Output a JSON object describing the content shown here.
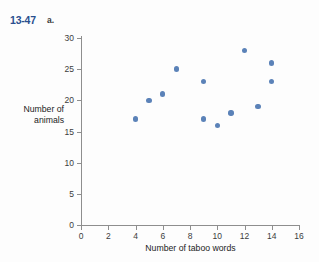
{
  "exercise": {
    "number": "13-47",
    "part": "a."
  },
  "chart_data": {
    "type": "scatter",
    "title": "",
    "xlabel": "Number of taboo words",
    "ylabel": "Number of\nanimals",
    "ylabel_lines": [
      "Number of",
      "animals"
    ],
    "xlim": [
      0,
      16
    ],
    "ylim": [
      0,
      30
    ],
    "xticks": [
      0,
      2,
      4,
      6,
      8,
      10,
      12,
      14,
      16
    ],
    "yticks": [
      0,
      5,
      10,
      15,
      20,
      25,
      30
    ],
    "grid": false,
    "legend": null,
    "marker_color": "#5b82b8",
    "axis_color": "#8e8e8e",
    "points": [
      {
        "x": 4,
        "y": 17
      },
      {
        "x": 5,
        "y": 20
      },
      {
        "x": 6,
        "y": 21
      },
      {
        "x": 7,
        "y": 25
      },
      {
        "x": 9,
        "y": 23
      },
      {
        "x": 9,
        "y": 17
      },
      {
        "x": 10,
        "y": 16
      },
      {
        "x": 11,
        "y": 18
      },
      {
        "x": 12,
        "y": 28
      },
      {
        "x": 13,
        "y": 19
      },
      {
        "x": 14,
        "y": 26
      },
      {
        "x": 14,
        "y": 23
      }
    ]
  }
}
